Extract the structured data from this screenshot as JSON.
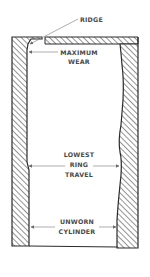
{
  "diagram": {
    "colors": {
      "outline": "#2a2a2a",
      "hatch": "#3a3a3a",
      "leader": "#8a8a8a",
      "text": "#4a4a4a",
      "background": "#ffffff"
    },
    "labels": {
      "ridge": "RIDGE",
      "maximum_wear": {
        "line1": "MAXIMUM",
        "line2": "WEAR"
      },
      "lowest_ring_travel": {
        "line1": "LOWEST",
        "line2": "RING",
        "line3": "TRAVEL"
      },
      "unworn_cylinder": {
        "line1": "UNWORN",
        "line2": "CYLINDER"
      }
    }
  }
}
